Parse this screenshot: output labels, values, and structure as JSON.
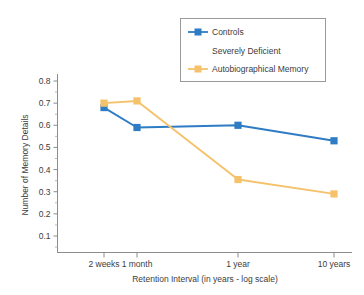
{
  "chart_data": {
    "type": "line",
    "title": "",
    "xlabel": "Retention Interval (in years - log scale)",
    "ylabel": "Number of Memory Details",
    "categories": [
      "2 weeks",
      "1 month",
      "1 year",
      "10 years"
    ],
    "x_positions": [
      104,
      137,
      238,
      334
    ],
    "ylim": [
      0.0,
      0.85
    ],
    "y_ticks": [
      "0.1",
      "0.2",
      "0.3",
      "0.4",
      "0.5",
      "0.6",
      "0.7",
      "0.8"
    ],
    "y_tick_values": [
      0.1,
      0.2,
      0.3,
      0.4,
      0.5,
      0.6,
      0.7,
      0.8
    ],
    "grid": false,
    "legend_position": "top-right",
    "series": [
      {
        "name": "Controls",
        "color": "#2e7cc4",
        "marker": "square",
        "values": [
          0.68,
          0.59,
          0.6,
          0.53
        ]
      },
      {
        "name": "Severely Deficient Autobiographical Memory",
        "color": "#f5c26b",
        "marker": "square",
        "values": [
          0.7,
          0.71,
          0.355,
          0.29
        ]
      }
    ]
  },
  "legend": {
    "entries": [
      {
        "label": "Controls",
        "color": "#2e7cc4",
        "has_marker": true
      },
      {
        "label": "Severely Deficient",
        "color": "#f5c26b",
        "has_marker": false
      },
      {
        "label": "Autobiographical Memory",
        "color": "#f5c26b",
        "has_marker": true
      }
    ]
  },
  "axes": {
    "y_title": "Number of Memory Details",
    "x_title": "Retention Interval (in years - log scale)",
    "y_labels": [
      "0.8",
      "0.7",
      "0.6",
      "0.5",
      "0.4",
      "0.3",
      "0.2",
      "0.1"
    ],
    "x_labels": [
      "2 weeks",
      "1 month",
      "1 year",
      "10 years"
    ]
  },
  "colors": {
    "controls": "#2e7cc4",
    "sdam": "#f5c26b",
    "axis": "#8c8c8c",
    "text": "#3c3c3c",
    "background": "#ffffff"
  }
}
